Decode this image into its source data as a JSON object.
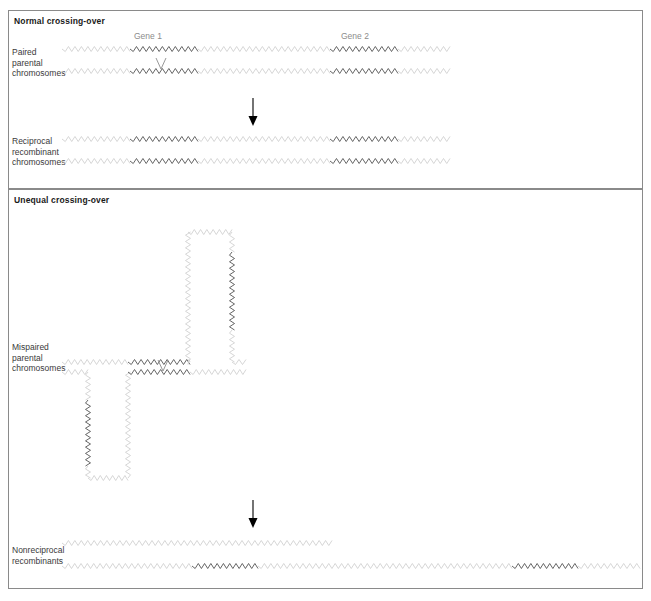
{
  "figure": {
    "width": 651,
    "height": 601,
    "background": "#ffffff",
    "frame_color": "#8a8a8a"
  },
  "colors": {
    "chromosome_light": "#cfcfcf",
    "gene_dark": "#4a4a4a",
    "text_dark": "#1a1a1a",
    "text_label": "#3a3a3a",
    "text_muted": "#8c8c8c",
    "arrow": "#000000"
  },
  "panels": [
    {
      "id": "normal",
      "title": "Normal crossing-over",
      "rows": [
        {
          "id": "paired-parental",
          "label": "Paired\nparental\nchromosomes",
          "description": "Two homologous chromosomes aligned in register with a single crossover between the Gene 1 copies."
        },
        {
          "id": "reciprocal-recombinant",
          "label": "Reciprocal\nrecombinant\nchromosomes",
          "description": "Both products retain one copy of Gene 1 and one copy of Gene 2; no gain or loss of material."
        }
      ],
      "gene_captions": [
        {
          "id": "gene-1",
          "text": "Gene 1"
        },
        {
          "id": "gene-2",
          "text": "Gene 2"
        }
      ]
    },
    {
      "id": "unequal",
      "title": "Unequal crossing-over",
      "rows": [
        {
          "id": "mispaired-parental",
          "label": "Mispaired\nparental\nchromosomes",
          "description": "Chromosomes misalign so that Gene 1 on one chromatid pairs with Gene 2 on the other; the unpaired material loops out above and below."
        },
        {
          "id": "nonreciprocal-recombinants",
          "label": "Nonreciprocal\nrecombinants",
          "description": "One product carries a deletion (shortened, no genes) and the other carries a duplication with two dark gene blocks."
        }
      ]
    }
  ],
  "arrows": [
    {
      "id": "arrow-normal",
      "direction": "down"
    },
    {
      "id": "arrow-unequal",
      "direction": "down"
    }
  ],
  "diagram_data": {
    "type": "diagram",
    "subject": "Normal versus unequal crossing-over between homologous chromosomes",
    "strand_style": "zig-zag / sinusoidal line representing a chromosome",
    "segment_legend": [
      {
        "tone": "light-gray",
        "meaning": "non-genic chromosome arm"
      },
      {
        "tone": "dark-gray",
        "meaning": "gene-containing segment"
      }
    ]
  }
}
